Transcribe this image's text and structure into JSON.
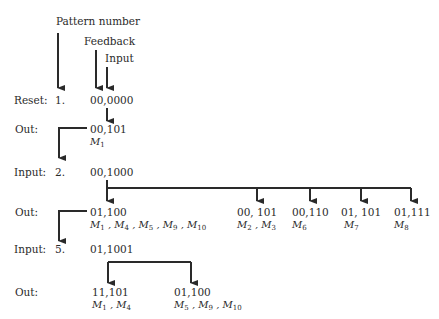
{
  "headers": {
    "pattern_number": "Pattern number",
    "feedback": "Feedback",
    "input": "Input"
  },
  "rows": [
    {
      "label": "Reset:",
      "pattern": "1.",
      "value": "00,0000"
    },
    {
      "label": "Out:",
      "outputs": [
        {
          "value": "00,101",
          "members": [
            "M1"
          ]
        }
      ]
    },
    {
      "label": "Input:",
      "pattern": "2.",
      "value": "00,1000"
    },
    {
      "label": "Out:",
      "outputs": [
        {
          "value": "01,100",
          "members": [
            "M1",
            "M4",
            "M5",
            "M9",
            "M10"
          ]
        },
        {
          "value": "00, 101",
          "members": [
            "M2",
            "M3"
          ]
        },
        {
          "value": "00,110",
          "members": [
            "M6"
          ]
        },
        {
          "value": "01, 101",
          "members": [
            "M7"
          ]
        },
        {
          "value": "01,111",
          "members": [
            "M8"
          ]
        }
      ]
    },
    {
      "label": "Input:",
      "pattern": "5.",
      "value": "01,1001"
    },
    {
      "label": "Out:",
      "outputs": [
        {
          "value": "11,101",
          "members": [
            "M1",
            "M4"
          ]
        },
        {
          "value": "01,100",
          "members": [
            "M5",
            "M9",
            "M10"
          ]
        }
      ]
    }
  ],
  "labels": {
    "reset": "Reset:",
    "out1": "Out:",
    "input2": "Input:",
    "out2": "Out:",
    "input5": "Input:",
    "out3": "Out:",
    "p1": "1.",
    "p2": "2.",
    "p5": "5.",
    "v_reset": "00,0000",
    "v_out1": "00,101",
    "v_in2": "00,1000",
    "v_out2a": "01,100",
    "v_out2b": "00, 101",
    "v_out2c": "00,110",
    "v_out2d": "01, 101",
    "v_out2e": "01,111",
    "v_in5": "01,1001",
    "v_out3a": "11,101",
    "v_out3b": "01,100"
  },
  "colors": {
    "ink": "#2a2a2a",
    "background": "#ffffff"
  }
}
